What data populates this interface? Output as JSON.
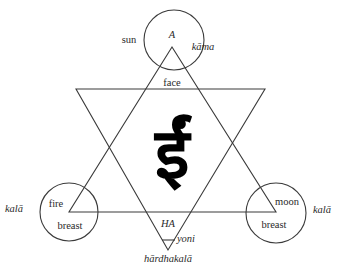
{
  "diagram": {
    "central_glyph": "ईं",
    "top": {
      "letter": "A",
      "circle_label": "kāma",
      "outer_label": "sun",
      "inner_label": "face"
    },
    "left": {
      "inner_top": "fire",
      "inner_bottom": "breast",
      "outer_label": "kalā"
    },
    "right": {
      "inner_top": "moon",
      "inner_bottom": "breast",
      "outer_label": "kalā"
    },
    "bottom": {
      "letter": "HA",
      "side_label": "yoni",
      "below_label": "hārdhakalā"
    }
  }
}
